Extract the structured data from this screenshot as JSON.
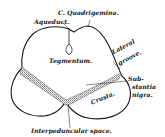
{
  "diagram": {
    "labels": {
      "c_quadrigemina": "C. Quadrigemina.",
      "aqueduct": "Aqueduct.",
      "tegmentum": "Tegmentum.",
      "lateral": "Lateral",
      "groove": "groove.",
      "sub": "Sub-",
      "stantia": "stantia",
      "nigra": "nigra.",
      "crusta": "Crusta.",
      "interpeduncular_space": "Interpeduncular space."
    },
    "colors": {
      "ink": "#1a1a1a",
      "background": "#ffffff",
      "substantia_nigra_shading": "#7a7a7a"
    }
  }
}
